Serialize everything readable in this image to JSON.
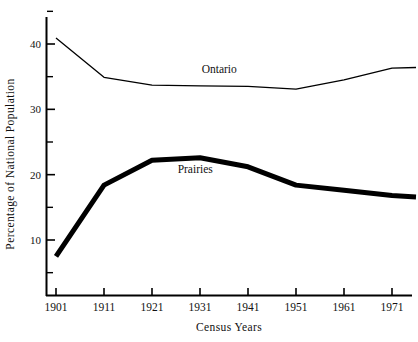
{
  "chart_data": {
    "type": "line",
    "title": "",
    "xlabel": "Census Years",
    "ylabel": "Percentage of National Population",
    "x": [
      1901,
      1911,
      1921,
      1931,
      1941,
      1951,
      1961,
      1971,
      1976
    ],
    "xtick_labels": [
      "1901",
      "1911",
      "1921",
      "1931",
      "1941",
      "1951",
      "1961",
      "1971"
    ],
    "xticks": [
      1901,
      1911,
      1921,
      1931,
      1941,
      1951,
      1961,
      1971
    ],
    "ytick_labels": [
      "10",
      "20",
      "30",
      "40"
    ],
    "yticks": [
      10,
      20,
      30,
      40
    ],
    "yticks_minor": [
      5,
      15,
      25,
      35,
      45
    ],
    "xlim": [
      1898.5,
      1977.5
    ],
    "ylim": [
      2.5,
      45.5
    ],
    "grid": false,
    "legend": "inline-annotations",
    "series": [
      {
        "name": "Ontario",
        "color": "#000000",
        "linewidth": 1.3,
        "label_x": 1935,
        "label_y": 35.6,
        "values": [
          40.9,
          34.9,
          33.7,
          33.6,
          33.5,
          33.1,
          34.5,
          36.3,
          36.4
        ]
      },
      {
        "name": "Prairies",
        "color": "#000000",
        "linewidth": 5.0,
        "label_x": 1930,
        "label_y": 20.3,
        "values": [
          7.5,
          18.4,
          22.2,
          22.6,
          21.2,
          18.4,
          17.6,
          16.8,
          16.6
        ]
      }
    ]
  },
  "axes": {
    "y_axis_title": "Percentage of National Population",
    "x_axis_title": "Census Years"
  },
  "annotations": {
    "ontario_label": "Ontario",
    "prairies_label": "Prairies"
  }
}
